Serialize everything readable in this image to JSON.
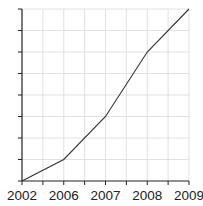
{
  "chart_data": {
    "type": "line",
    "title": "",
    "xlabel": "",
    "ylabel": "",
    "categories": [
      "2002",
      "2006",
      "2007",
      "2008",
      "2009"
    ],
    "series": [
      {
        "name": "series-1",
        "values": [
          0,
          1,
          3,
          6,
          8
        ]
      }
    ],
    "ylim": [
      0,
      8
    ],
    "y_divisions": 8,
    "y_tick_labels": [],
    "x_minor_ticks": true,
    "grid": true,
    "legend": null,
    "colors": {
      "line": "#333333",
      "grid": "#d9d9d9",
      "axis": "#222222"
    }
  }
}
